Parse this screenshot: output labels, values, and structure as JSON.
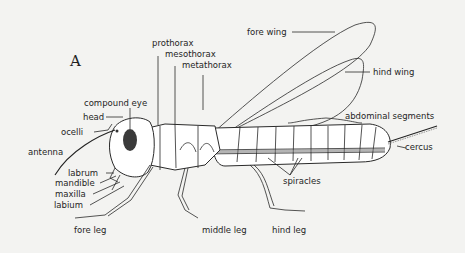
{
  "figure": {
    "panel_label": "A",
    "labels": {
      "prothorax": "prothorax",
      "mesothorax": "mesothorax",
      "metathorax": "metathorax",
      "fore_wing": "fore wing",
      "hind_wing": "hind wing",
      "compound_eye": "compound eye",
      "head": "head",
      "ocelli": "ocelli",
      "antenna": "antenna",
      "labrum": "labrum",
      "mandible": "mandible",
      "maxilla": "maxilla",
      "labium": "labium",
      "fore_leg": "fore leg",
      "middle_leg": "middle leg",
      "hind_leg": "hind leg",
      "abdominal_segments": "abdominal segments",
      "cercus": "cercus",
      "spiracles": "spiracles"
    },
    "colors": {
      "background": "#f3f3f1",
      "ink": "#1f1f1f",
      "eye": "#3a3a3a"
    }
  }
}
